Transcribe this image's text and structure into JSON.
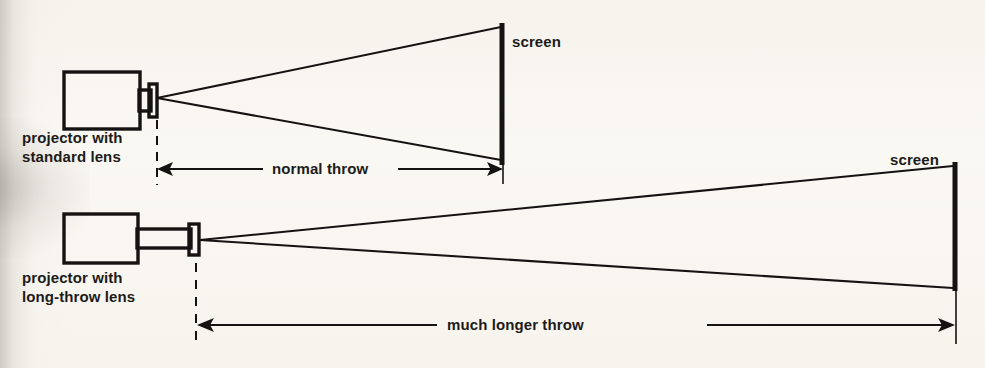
{
  "diagram": {
    "ink_color": "#151312",
    "paper_color": "#faf8f3",
    "top": {
      "projector_label_line1": "projector with",
      "projector_label_line2": "standard lens",
      "screen_label": "screen",
      "throw_label": "normal throw",
      "lens_type": "standard-lens",
      "lens_barrel_length_px": 16,
      "cone_apex": {
        "x": 157,
        "y": 98
      },
      "screen": {
        "x": 502,
        "top": 23,
        "bottom": 165
      },
      "throw_dimension": {
        "from_x": 157,
        "to_x": 503,
        "y": 169
      }
    },
    "bottom": {
      "projector_label_line1": "projector with",
      "projector_label_line2": "long-throw lens",
      "screen_label": "screen",
      "throw_label": "much longer throw",
      "lens_type": "long-throw-lens",
      "lens_barrel_length_px": 54,
      "cone_apex": {
        "x": 200,
        "y": 240
      },
      "screen": {
        "x": 955,
        "top": 162,
        "bottom": 291
      },
      "throw_dimension": {
        "from_x": 197,
        "to_x": 955,
        "y": 325
      }
    }
  }
}
